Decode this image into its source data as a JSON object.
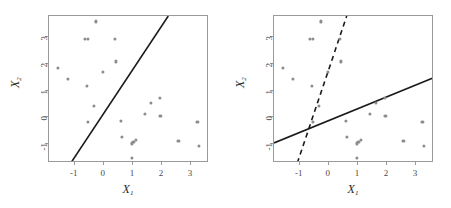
{
  "figure": {
    "caption": "",
    "background": "#ffffff",
    "point_color": "#8c8c8c",
    "line_color": "#1a1a1a",
    "frame_color": "#9a9a9a"
  },
  "chart_data": [
    {
      "type": "scatter",
      "panel": "left",
      "title": "",
      "xlabel": "X1",
      "ylabel": "X2",
      "xlim": [
        -1.85,
        3.65
      ],
      "ylim": [
        -1.75,
        3.75
      ],
      "xticks": [
        -1,
        0,
        1,
        2,
        3
      ],
      "yticks": [
        -1,
        0,
        1,
        2,
        3
      ],
      "xticklabels": [
        "-1",
        "0",
        "1",
        "2",
        "3"
      ],
      "yticklabels": [
        "-1",
        "0",
        "1",
        "2",
        "3"
      ],
      "grid": false,
      "legend": "none",
      "x": [
        -0.25,
        -0.62,
        -0.52,
        0.42,
        -1.55,
        -1.2,
        -0.55,
        0.45,
        0.0,
        -0.3,
        -0.5,
        0.62,
        1.0,
        0.65,
        1.65,
        1.95,
        1.45,
        1.98,
        3.25,
        1.05,
        1.15,
        2.6,
        3.3,
        1.0
      ],
      "y": [
        3.55,
        2.9,
        2.9,
        2.9,
        1.82,
        1.4,
        1.12,
        2.05,
        1.67,
        0.38,
        -0.2,
        -0.18,
        -1.02,
        -0.78,
        0.5,
        0.7,
        0.08,
        0.02,
        -0.2,
        -0.95,
        -0.9,
        -0.92,
        -1.1,
        -1.55
      ],
      "lines": [
        {
          "name": "separating-hyperplane",
          "style": "solid",
          "p1": [
            -1.1,
            -1.75
          ],
          "p2": [
            2.25,
            3.75
          ]
        }
      ]
    },
    {
      "type": "scatter",
      "panel": "right",
      "title": "",
      "xlabel": "X1",
      "ylabel": "X2",
      "xlim": [
        -1.85,
        3.65
      ],
      "ylim": [
        -1.75,
        3.75
      ],
      "xticks": [
        -1,
        0,
        1,
        2,
        3
      ],
      "yticks": [
        -1,
        0,
        1,
        2,
        3
      ],
      "xticklabels": [
        "-1",
        "0",
        "1",
        "2",
        "3"
      ],
      "yticklabels": [
        "-1",
        "0",
        "1",
        "2",
        "3"
      ],
      "grid": false,
      "legend": "none",
      "x": [
        -0.25,
        -0.62,
        -0.52,
        0.42,
        -1.55,
        -1.2,
        -0.55,
        0.45,
        0.0,
        -0.3,
        -0.5,
        0.62,
        1.0,
        0.65,
        1.65,
        1.95,
        1.45,
        1.98,
        3.25,
        1.05,
        1.15,
        2.6,
        3.3,
        1.0
      ],
      "y": [
        3.55,
        2.9,
        2.9,
        2.9,
        1.82,
        1.4,
        1.12,
        2.05,
        1.67,
        0.38,
        -0.2,
        -0.18,
        -1.02,
        -0.78,
        0.5,
        0.7,
        0.08,
        0.02,
        -0.2,
        -0.95,
        -0.9,
        -0.92,
        -1.1,
        -1.55
      ],
      "lines": [
        {
          "name": "separating-hyperplane-solid",
          "style": "solid",
          "p1": [
            -1.85,
            -1.0
          ],
          "p2": [
            3.65,
            1.45
          ]
        },
        {
          "name": "separating-hyperplane-dashed",
          "style": "dashed",
          "p1": [
            -1.05,
            -1.75
          ],
          "p2": [
            0.65,
            3.75
          ]
        }
      ]
    }
  ]
}
